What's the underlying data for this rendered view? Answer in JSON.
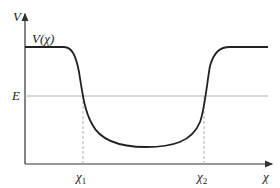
{
  "diagram": {
    "y_axis_label": "V",
    "x_axis_label": "χ",
    "curve_label": "V(χ)",
    "energy_label": "E",
    "turning_points": [
      {
        "symbol": "χ",
        "subscript": "1"
      },
      {
        "symbol": "χ",
        "subscript": "2"
      }
    ]
  },
  "colors": {
    "curve": "#222222",
    "axes": "#333333",
    "guides": "#b0b0b0"
  }
}
